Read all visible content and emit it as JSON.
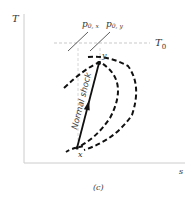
{
  "diagram": {
    "type": "T-s diagram",
    "axes": {
      "y_label": "T",
      "x_label": "s"
    },
    "reference_line": {
      "label": "T",
      "subscript": "0"
    },
    "isobars": [
      {
        "label": "p",
        "subscript": "0, x"
      },
      {
        "label": "p",
        "subscript": "0, y"
      }
    ],
    "points": {
      "start": "x",
      "end": "y"
    },
    "process_label": "Normal shock",
    "caption": "(c)",
    "colors": {
      "ink": "#111111",
      "axis": "#cccccc",
      "guide": "#bbbbbb"
    }
  }
}
